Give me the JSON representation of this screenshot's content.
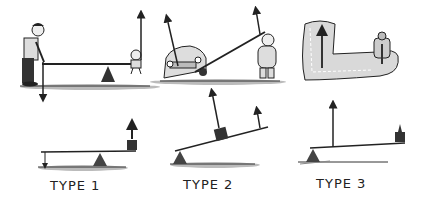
{
  "diagram": {
    "panels": [
      {
        "label": "TYPE 1",
        "scene": "adult and child on seesaw",
        "arrangement": "fulcrum between effort and load"
      },
      {
        "label": "TYPE 2",
        "scene": "person lifting car with a bar",
        "arrangement": "load between fulcrum and effort"
      },
      {
        "label": "TYPE 3",
        "scene": "forearm holding a bottle",
        "arrangement": "effort between fulcrum and load"
      }
    ],
    "colors": {
      "ink": "#222222",
      "fulcrum": "#444444",
      "shade": "#bdbdbd",
      "background": "#ffffff"
    }
  }
}
